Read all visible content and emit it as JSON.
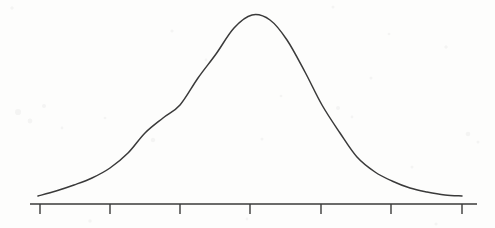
{
  "figure": {
    "kind": "hand-drawn-scanned-figure",
    "background_color": "#fdfdfc",
    "ink_color": "#3a3a3a",
    "width": 495,
    "height": 228
  },
  "chart_data": {
    "type": "line",
    "title": "",
    "subtitle": "",
    "xlabel": "",
    "ylabel": "",
    "grid": false,
    "legend": null,
    "legend_position": "none",
    "annotations": [],
    "distribution": {
      "name": "normal",
      "mean_tick_index": 3,
      "sigma_in_ticks": 1,
      "peak_value": 1.0,
      "baseline_value": 0.0
    },
    "axis": {
      "line_y": 204,
      "x_start": 30,
      "x_end": 477,
      "stroke_width": 1.6,
      "tick_length": 10,
      "tick_stroke_width": 1.4,
      "tick_count": 7,
      "tick_spacing_px": 70.5,
      "tick_labels": [
        "",
        "",
        "",
        "",
        "",
        "",
        ""
      ],
      "tick_positions_px": [
        40,
        110,
        180,
        250,
        321,
        391,
        462
      ]
    },
    "curve": {
      "stroke_width": 1.5,
      "peak_point": [
        252,
        15
      ],
      "left_end_point": [
        38,
        196
      ],
      "right_end_point": [
        462,
        196
      ],
      "inflection_points": [
        [
          180,
          105
        ],
        [
          322,
          105
        ]
      ],
      "xlim": [
        38,
        462
      ],
      "ylim": [
        0,
        1
      ],
      "x": [
        38,
        74,
        110,
        145,
        180,
        216,
        252,
        287,
        322,
        357,
        392,
        427,
        462
      ],
      "y": [
        0.0,
        0.04,
        0.2,
        0.53,
        0.55,
        0.92,
        1.0,
        0.92,
        0.55,
        0.2,
        0.2,
        0.04,
        0.0
      ],
      "sample_points_px": [
        [
          38,
          196
        ],
        [
          56,
          191
        ],
        [
          74,
          185
        ],
        [
          92,
          178
        ],
        [
          110,
          168
        ],
        [
          128,
          153
        ],
        [
          145,
          133
        ],
        [
          163,
          118
        ],
        [
          180,
          105
        ],
        [
          198,
          78
        ],
        [
          216,
          54
        ],
        [
          234,
          28
        ],
        [
          252,
          15
        ],
        [
          270,
          20
        ],
        [
          287,
          40
        ],
        [
          305,
          72
        ],
        [
          322,
          105
        ],
        [
          340,
          133
        ],
        [
          357,
          157
        ],
        [
          375,
          172
        ],
        [
          392,
          181
        ],
        [
          410,
          188
        ],
        [
          427,
          192
        ],
        [
          445,
          195
        ],
        [
          462,
          196
        ]
      ]
    }
  }
}
